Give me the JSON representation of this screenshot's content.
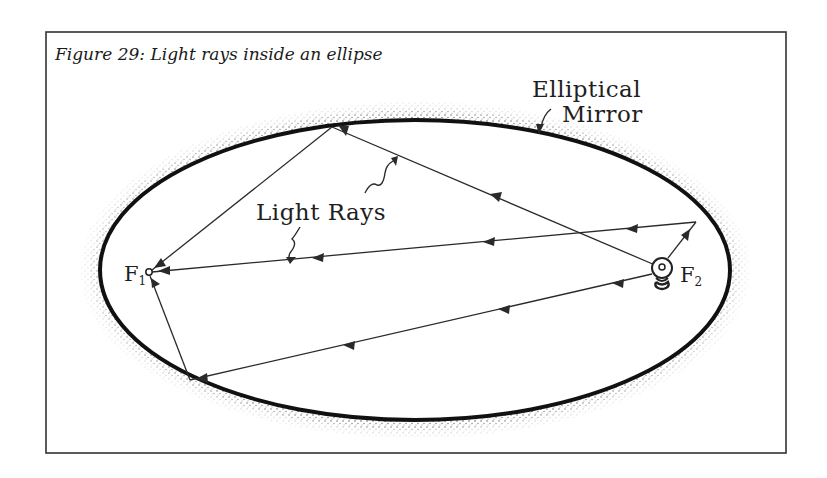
{
  "figure": {
    "caption": "Figure 29: Light rays inside an ellipse",
    "frame": {
      "x": 46,
      "y": 32,
      "width": 740,
      "height": 421,
      "stroke": "#333333"
    }
  },
  "mirror": {
    "label_line1": "Elliptical",
    "label_line2": "Mirror",
    "center": [
      415,
      270
    ],
    "rx": 315,
    "ry": 150,
    "stroke": "#111111"
  },
  "rays": {
    "label": "Light Rays",
    "color": "#2a2a2a",
    "paths": [
      {
        "name": "ray-top",
        "points": [
          [
            662,
            268
          ],
          [
            332,
            127
          ],
          [
            148,
            272
          ]
        ]
      },
      {
        "name": "ray-right",
        "points": [
          [
            662,
            268
          ],
          [
            696,
            222
          ],
          [
            148,
            272
          ]
        ]
      },
      {
        "name": "ray-bottom",
        "points": [
          [
            662,
            268
          ],
          [
            190,
            380
          ],
          [
            148,
            272
          ]
        ]
      }
    ]
  },
  "foci": {
    "f1": {
      "letter": "F",
      "subscript": "1",
      "position": [
        148,
        272
      ]
    },
    "f2": {
      "letter": "F",
      "subscript": "2",
      "position": [
        662,
        268
      ],
      "icon": "light-bulb-icon"
    }
  },
  "diagram_data": {
    "type": "ellipse-reflection",
    "nodes": [
      "F1 (focus, receiver)",
      "F2 (focus, light source)",
      "Elliptical Mirror"
    ],
    "edges": [
      "F2 -> top of mirror -> F1",
      "F2 -> right of mirror -> F1",
      "F2 -> bottom-left of mirror -> F1"
    ]
  }
}
